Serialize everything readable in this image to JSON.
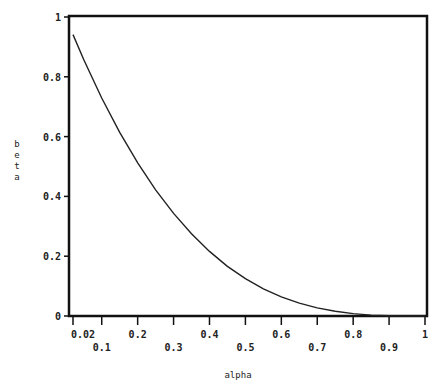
{
  "chart_data": {
    "type": "line",
    "title": "",
    "xlabel": "alpha",
    "ylabel": "beta",
    "xlim": [
      0.0,
      1.0
    ],
    "ylim": [
      0,
      1
    ],
    "grid": false,
    "legend": null,
    "x_ticks": [
      {
        "value": 0.02,
        "label": "0.02",
        "row": 0
      },
      {
        "value": 0.1,
        "label": "0.1",
        "row": 1
      },
      {
        "value": 0.2,
        "label": "0.2",
        "row": 0
      },
      {
        "value": 0.3,
        "label": "0.3",
        "row": 1
      },
      {
        "value": 0.4,
        "label": "0.4",
        "row": 0
      },
      {
        "value": 0.5,
        "label": "0.5",
        "row": 1
      },
      {
        "value": 0.6,
        "label": "0.6",
        "row": 0
      },
      {
        "value": 0.7,
        "label": "0.7",
        "row": 1
      },
      {
        "value": 0.8,
        "label": "0.8",
        "row": 0
      },
      {
        "value": 0.9,
        "label": "0.9",
        "row": 1
      },
      {
        "value": 1.0,
        "label": "1",
        "row": 0
      }
    ],
    "y_ticks": [
      {
        "value": 0,
        "label": "0"
      },
      {
        "value": 0.2,
        "label": "0.2"
      },
      {
        "value": 0.4,
        "label": "0.4"
      },
      {
        "value": 0.6,
        "label": "0.6"
      },
      {
        "value": 0.8,
        "label": "0.8"
      },
      {
        "value": 1,
        "label": "1"
      }
    ],
    "series": [
      {
        "name": "beta vs alpha",
        "x": [
          0.02,
          0.05,
          0.1,
          0.15,
          0.2,
          0.25,
          0.3,
          0.35,
          0.4,
          0.45,
          0.5,
          0.55,
          0.6,
          0.65,
          0.7,
          0.75,
          0.8,
          0.85,
          0.9,
          0.95,
          1.0
        ],
        "y": [
          0.941,
          0.857,
          0.729,
          0.614,
          0.512,
          0.422,
          0.343,
          0.275,
          0.216,
          0.166,
          0.125,
          0.091,
          0.064,
          0.043,
          0.027,
          0.016,
          0.008,
          0.003,
          0.001,
          0.0001,
          0.0
        ]
      }
    ]
  }
}
